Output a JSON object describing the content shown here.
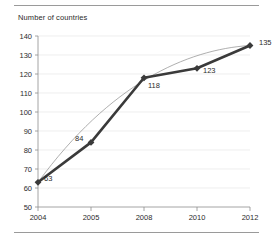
{
  "chart_data": {
    "type": "line",
    "title": "Number of countries",
    "xlabel": "",
    "ylabel": "",
    "x": [
      2004,
      2005,
      2008,
      2010,
      2012
    ],
    "categories": [
      "2004",
      "2005",
      "2008",
      "2010",
      "2012"
    ],
    "values": [
      63,
      84,
      118,
      123,
      135
    ],
    "point_labels": [
      "63",
      "84",
      "118",
      "123",
      "135"
    ],
    "series": [
      {
        "name": "Number of countries",
        "values": [
          63,
          84,
          118,
          123,
          135
        ],
        "marker": "diamond",
        "color": "#3a3a3a"
      },
      {
        "name": "trend",
        "style": "thin-smooth-curve",
        "color": "#8d8d8d"
      }
    ],
    "xlim": [
      2004,
      2012
    ],
    "ylim": [
      50,
      140
    ],
    "ytick_labels": [
      "140",
      "130",
      "120",
      "110",
      "100",
      "90",
      "80",
      "70",
      "60",
      "50"
    ],
    "ytick_values": [
      140,
      130,
      120,
      110,
      100,
      90,
      80,
      70,
      60,
      50
    ],
    "xtick_labels": [
      "2004",
      "2005",
      "2008",
      "2010",
      "2012"
    ],
    "grid": "horizontal",
    "legend": "none",
    "grid_color": "#e2e2e2",
    "axis_color": "#8d8d8d",
    "text_color": "#2b2b2b",
    "rule_color": "#9a9a9a"
  }
}
